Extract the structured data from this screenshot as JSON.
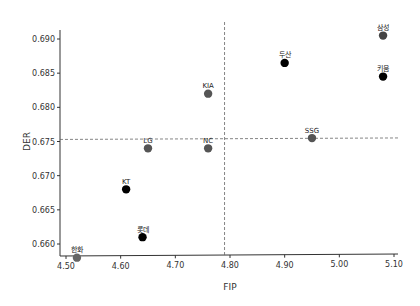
{
  "chart_data": {
    "type": "scatter",
    "title": "",
    "xlabel": "FIP",
    "ylabel": "DER",
    "xlim": [
      4.5,
      5.1
    ],
    "ylim": [
      0.657,
      0.692
    ],
    "xticks": [
      "4.50",
      "4.60",
      "4.70",
      "4.80",
      "4.90",
      "5.00",
      "5.10"
    ],
    "yticks": [
      "0.660",
      "0.665",
      "0.670",
      "0.675",
      "0.680",
      "0.685",
      "0.690"
    ],
    "grid": false,
    "legend": null,
    "reference_lines": {
      "vertical_x": 4.79,
      "horizontal_y": 0.6753,
      "style": "dashed",
      "color": "#666666"
    },
    "points": [
      {
        "label": "한화",
        "x": 4.52,
        "y": 0.658,
        "color": "#666666"
      },
      {
        "label": "KT",
        "x": 4.61,
        "y": 0.668,
        "color": "#000000"
      },
      {
        "label": "롯데",
        "x": 4.64,
        "y": 0.661,
        "color": "#000000"
      },
      {
        "label": "LG",
        "x": 4.65,
        "y": 0.674,
        "color": "#555555"
      },
      {
        "label": "NC",
        "x": 4.76,
        "y": 0.674,
        "color": "#555555"
      },
      {
        "label": "KIA",
        "x": 4.76,
        "y": 0.682,
        "color": "#555555"
      },
      {
        "label": "두산",
        "x": 4.9,
        "y": 0.6865,
        "color": "#000000"
      },
      {
        "label": "SSG",
        "x": 4.95,
        "y": 0.6755,
        "color": "#555555"
      },
      {
        "label": "삼성",
        "x": 5.08,
        "y": 0.6905,
        "color": "#444444"
      },
      {
        "label": "키움",
        "x": 5.08,
        "y": 0.6845,
        "color": "#000000"
      }
    ]
  }
}
